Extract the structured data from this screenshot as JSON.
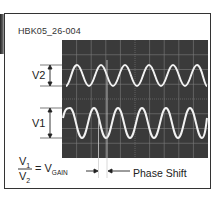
{
  "figure": {
    "id_label": "HBK05_26-004",
    "labels": {
      "v2": "V2",
      "v1": "V1",
      "phase_shift": "Phase Shift"
    },
    "equation": {
      "numerator": "V",
      "numerator_sub": "1",
      "denominator": "V",
      "denominator_sub": "2",
      "equals": "=",
      "result": "V",
      "result_sub": "GAIN"
    },
    "scope": {
      "grid_columns": 10,
      "grid_rows": 8,
      "traces": [
        {
          "name": "V2 (input)",
          "cycles": 5,
          "amplitude": "small"
        },
        {
          "name": "V1 (output)",
          "cycles": 5,
          "amplitude": "large"
        }
      ]
    },
    "colors": {
      "screen": "#3a3a3a",
      "grid": "#8a8a8a",
      "trace": "#f2f2f2",
      "text": "#222222"
    }
  }
}
